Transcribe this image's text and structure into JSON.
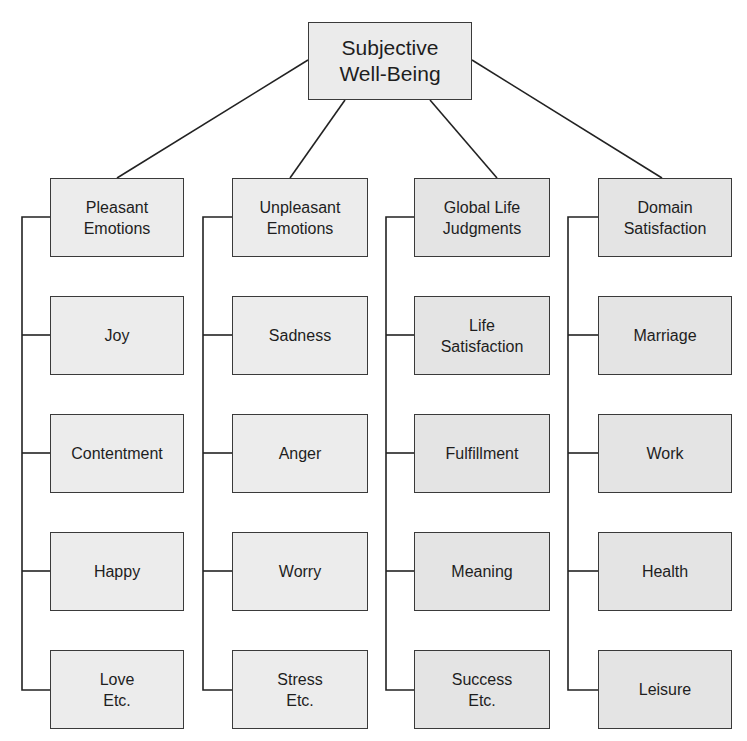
{
  "diagram": {
    "root": {
      "label": "Subjective\nWell-Being"
    },
    "categories": [
      {
        "label": "Pleasant\nEmotions",
        "children": [
          "Joy",
          "Contentment",
          "Happy",
          "Love\nEtc."
        ]
      },
      {
        "label": "Unpleasant\nEmotions",
        "children": [
          "Sadness",
          "Anger",
          "Worry",
          "Stress\nEtc."
        ]
      },
      {
        "label": "Global Life\nJudgments",
        "children": [
          "Life\nSatisfaction",
          "Fulfillment",
          "Meaning",
          "Success\nEtc."
        ]
      },
      {
        "label": "Domain\nSatisfaction",
        "children": [
          "Marriage",
          "Work",
          "Health",
          "Leisure"
        ]
      }
    ]
  }
}
